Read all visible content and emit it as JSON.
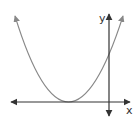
{
  "diagram": {
    "type": "parabola-graph",
    "axes": {
      "x_label": "x",
      "y_label": "y",
      "axis_color": "#333333"
    },
    "curve": {
      "description": "upward-opening parabola with vertex on the negative x-axis",
      "color": "#888888"
    }
  }
}
